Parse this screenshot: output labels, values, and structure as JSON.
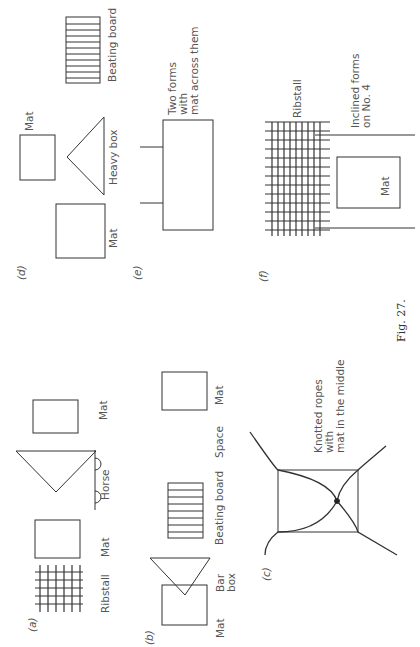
{
  "figure": {
    "caption": "Fig. 27.",
    "panels": {
      "a": {
        "tag": "(a)",
        "items": [
          "Ribstall",
          "Mat",
          "Horse",
          "Mat"
        ]
      },
      "b": {
        "tag": "(b)",
        "items": [
          "Mat",
          "Bar box",
          "Beating board",
          "Space",
          "Mat"
        ],
        "bar_box_line1": "Bar",
        "bar_box_line2": "box"
      },
      "c": {
        "tag": "(c)",
        "label_line1": "Knotted ropes",
        "label_line2": "with",
        "label_line3": "mat in the middle"
      },
      "d": {
        "tag": "(d)",
        "items": [
          "Mat",
          "Mat",
          "Heavy box",
          "Beating board"
        ]
      },
      "e": {
        "tag": "(e)",
        "label_line1": "Two forms",
        "label_line2": "with",
        "label_line3": "mat across them"
      },
      "f": {
        "tag": "(f)",
        "ribstall": "Ribstall",
        "label_line1": "Inclined forms",
        "label_line2": "on No. 4",
        "mat": "Mat"
      }
    }
  }
}
